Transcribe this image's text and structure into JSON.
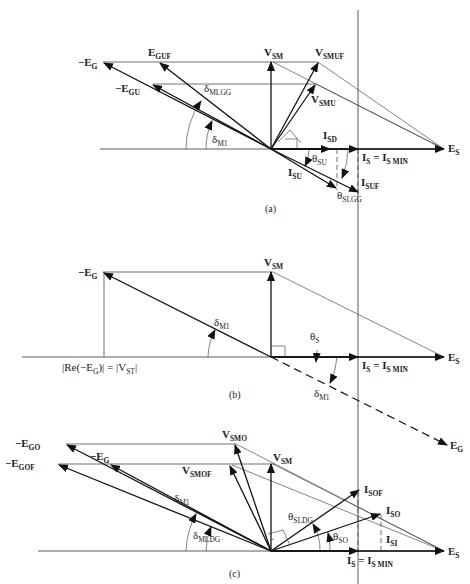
{
  "panels": [
    {
      "caption": "(a)",
      "labels": {
        "neg_eg": {
          "pre": "−E",
          "sub": "G"
        },
        "neg_egu": {
          "pre": "−E",
          "sub": "GU"
        },
        "egu_f": {
          "pre": "E",
          "sub": "GUF"
        },
        "vsm": {
          "pre": "V",
          "sub": "SM"
        },
        "vsmuf": {
          "pre": "V",
          "sub": "SMUF"
        },
        "vsmu": {
          "pre": "V",
          "sub": "SMU"
        },
        "delta_mlgg": {
          "pre": "δ",
          "sub": "MLGG"
        },
        "delta_m1": {
          "pre": "δ",
          "sub": "M1"
        },
        "isd": {
          "pre": "I",
          "sub": "SD"
        },
        "isu": {
          "pre": "I",
          "sub": "SU"
        },
        "isuf": {
          "pre": "I",
          "sub": "SUF"
        },
        "theta_su": {
          "pre": "θ",
          "sub": "SU"
        },
        "theta_slgg": {
          "pre": "θ",
          "sub": "SLGG"
        },
        "is_eq": {
          "pre": "I",
          "sub": "S",
          "mid": " = I",
          "sub2": "S MIN"
        },
        "es": {
          "pre": "E",
          "sub": "S"
        }
      }
    },
    {
      "caption": "(b)",
      "labels": {
        "neg_eg": {
          "pre": "−E",
          "sub": "G"
        },
        "vsm": {
          "pre": "V",
          "sub": "SM"
        },
        "delta_m1": {
          "pre": "δ",
          "sub": "M1"
        },
        "delta_m1_lower": {
          "pre": "δ",
          "sub": "M1"
        },
        "theta_s": {
          "pre": "θ",
          "sub": "S"
        },
        "is_eq": {
          "pre": "I",
          "sub": "S",
          "mid": " = I",
          "sub2": "S MIN"
        },
        "es": {
          "pre": "E",
          "sub": "S"
        },
        "eg": {
          "pre": "E",
          "sub": "G"
        },
        "re_label": {
          "text1": "|Re(−E",
          "sub1": "G",
          "text2": ")| = |V",
          "sub2": "ST",
          "text3": "|"
        }
      }
    },
    {
      "caption": "(c)",
      "labels": {
        "neg_ego": {
          "pre": "−E",
          "sub": "GO"
        },
        "neg_egof": {
          "pre": "−E",
          "sub": "GOF"
        },
        "neg_eg": {
          "pre": "−E",
          "sub": "G"
        },
        "vsmo": {
          "pre": "V",
          "sub": "SMO"
        },
        "vsmof": {
          "pre": "V",
          "sub": "SMOF"
        },
        "vsm": {
          "pre": "V",
          "sub": "SM"
        },
        "delta_m1": {
          "pre": "δ",
          "sub": "M1"
        },
        "delta_mldg": {
          "pre": "δ",
          "sub": "MLDG"
        },
        "theta_sldg": {
          "pre": "θ",
          "sub": "SLDG"
        },
        "theta_so": {
          "pre": "θ",
          "sub": "SO"
        },
        "isof": {
          "pre": "I",
          "sub": "SOF"
        },
        "iso": {
          "pre": "I",
          "sub": "SO"
        },
        "isi": {
          "pre": "I",
          "sub": "SI"
        },
        "is_eq": {
          "pre": "I",
          "sub": "S",
          "mid": " = I",
          "sub2": "S MIN"
        },
        "es": {
          "pre": "E",
          "sub": "S"
        }
      }
    }
  ]
}
